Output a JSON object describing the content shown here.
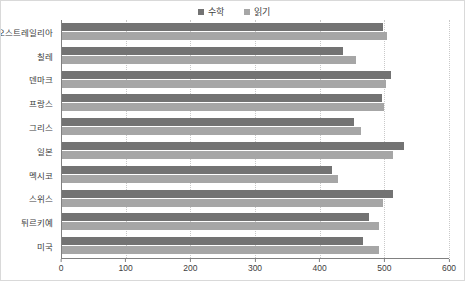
{
  "chart_data": {
    "type": "bar",
    "orientation": "horizontal",
    "title": "",
    "subtitle": "",
    "xlabel": "",
    "ylabel": "",
    "xlim": [
      0,
      600
    ],
    "xticks": [
      0,
      100,
      200,
      300,
      400,
      500,
      600
    ],
    "xtick_labels": [
      "0",
      "100",
      "200",
      "300",
      "400",
      "500",
      "600"
    ],
    "grid": "vertical-dotted",
    "legend_position": "top-center",
    "categories": [
      "오스트레일리아",
      "칠레",
      "덴마크",
      "프랑스",
      "그리스",
      "일본",
      "멕시코",
      "스위스",
      "튀르키예",
      "미국"
    ],
    "series": [
      {
        "name": "수학",
        "color": "#737373",
        "values": [
          497,
          435,
          509,
          495,
          452,
          529,
          418,
          512,
          474,
          465
        ]
      },
      {
        "name": "읽기",
        "color": "#a6a6a6",
        "values": [
          502,
          455,
          501,
          498,
          463,
          512,
          427,
          496,
          490,
          490
        ]
      }
    ]
  },
  "legend": {
    "items": [
      {
        "label": "수학",
        "color": "#737373"
      },
      {
        "label": "읽기",
        "color": "#a6a6a6"
      }
    ]
  },
  "axis": {
    "tick_labels": [
      "0",
      "100",
      "200",
      "300",
      "400",
      "500",
      "600"
    ]
  },
  "colors": {
    "math": "#737373",
    "reading": "#a6a6a6",
    "axis": "#808080",
    "grid": "#c9c9c9",
    "text": "#404040",
    "border": "#d9d9d9",
    "background": "#ffffff"
  }
}
